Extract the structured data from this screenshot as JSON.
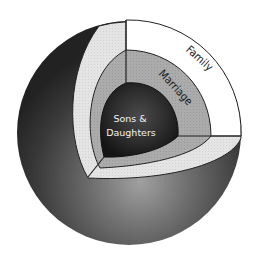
{
  "diagram": {
    "type": "nested-sphere-cutaway",
    "layers": [
      {
        "id": "family",
        "label": "Family",
        "color": "#ffffff"
      },
      {
        "id": "marriage",
        "label": "Marriage",
        "color": "#a9a9a9"
      },
      {
        "id": "core",
        "label_line1": "Sons &",
        "label_line2": "Daughters",
        "color": "#2a2a2a"
      }
    ],
    "colors": {
      "sphere_dark": "#262626",
      "sphere_light": "#8c8c8c",
      "cut_face_light": "#e6e6e6",
      "outline": "#222222"
    }
  }
}
